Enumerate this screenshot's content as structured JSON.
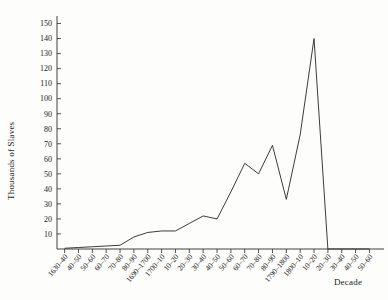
{
  "chart_data": {
    "type": "line",
    "title": "",
    "xlabel": "Decade",
    "ylabel": "Thousands of Slaves",
    "xlim": [
      0,
      22
    ],
    "ylim": [
      0,
      155
    ],
    "grid": false,
    "legend": "none",
    "ytick_labels": [
      "10",
      "20",
      "30",
      "40",
      "50",
      "60",
      "70",
      "80",
      "90",
      "100",
      "110",
      "120",
      "130",
      "140",
      "150"
    ],
    "ytick_values": [
      10,
      20,
      30,
      40,
      50,
      60,
      70,
      80,
      90,
      100,
      110,
      120,
      130,
      140,
      150
    ],
    "categories": [
      "1630–40",
      "40–50",
      "50–60",
      "60–70",
      "70–80",
      "80–90",
      "1690–1700",
      "1700–10",
      "10–20",
      "20–30",
      "30–40",
      "40–50",
      "50–60",
      "60–70",
      "70–80",
      "80–90",
      "1790–1800",
      "1800–10",
      "10–20",
      "20–30",
      "30–40",
      "40–50",
      "50–60"
    ],
    "values": [
      0.5,
      1,
      1.5,
      2,
      2.5,
      8,
      11,
      12,
      12,
      17,
      22,
      20,
      38,
      57,
      50,
      69,
      33,
      76,
      140,
      0,
      0,
      0,
      0
    ]
  }
}
